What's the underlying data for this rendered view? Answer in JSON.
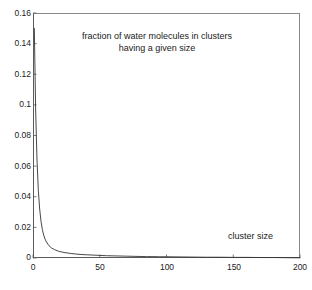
{
  "chart_data": {
    "type": "line",
    "title": "",
    "xlabel": "cluster size",
    "ylabel": "",
    "xlim": [
      0,
      200
    ],
    "ylim": [
      0,
      0.16
    ],
    "grid": false,
    "legend": "none",
    "xticks": [
      "0",
      "50",
      "100",
      "150",
      "200"
    ],
    "xtick_values": [
      0,
      50,
      100,
      150,
      200
    ],
    "yticks": [
      "0",
      "0.02",
      "0.04",
      "0.06",
      "0.08",
      "0.1",
      "0.12",
      "0.14",
      "0.16"
    ],
    "ytick_values": [
      0,
      0.02,
      0.04,
      0.06,
      0.08,
      0.1,
      0.12,
      0.14,
      0.16
    ],
    "annotations": [
      {
        "text_line1": "fraction of water molecules in clusters",
        "text_line2": "having a given size"
      },
      {
        "text": "cluster size"
      }
    ],
    "series": [
      {
        "name": "fraction of water molecules in clusters having a given size",
        "color": "#333333",
        "x": [
          1,
          2,
          3,
          4,
          5,
          6,
          7,
          8,
          9,
          10,
          12,
          14,
          16,
          18,
          20,
          24,
          28,
          32,
          36,
          40,
          45,
          50,
          55,
          60,
          65,
          70,
          75,
          80,
          85,
          90,
          95,
          100,
          110,
          120,
          130,
          140,
          150,
          160,
          170,
          180,
          190,
          200
        ],
        "y": [
          0.15,
          0.096,
          0.064,
          0.044,
          0.032,
          0.024,
          0.0186,
          0.015,
          0.0124,
          0.0105,
          0.008,
          0.0065,
          0.0055,
          0.0048,
          0.0042,
          0.0035,
          0.003,
          0.0026,
          0.0023,
          0.0021,
          0.0019,
          0.0017,
          0.0015,
          0.0014,
          0.0013,
          0.0012,
          0.0011,
          0.001,
          0.0009,
          0.0009,
          0.0008,
          0.0008,
          0.0007,
          0.0006,
          0.0005,
          0.0005,
          0.0004,
          0.0004,
          0.0003,
          0.0003,
          0.0002,
          0.0001
        ]
      }
    ]
  },
  "labels": {
    "title_line1": "fraction of water molecules in clusters",
    "title_line2": "having a given size",
    "cluster_size": "cluster size",
    "y0": "0",
    "y1": "0.02",
    "y2": "0.04",
    "y3": "0.06",
    "y4": "0.08",
    "y5": "0.1",
    "y6": "0.12",
    "y7": "0.14",
    "y8": "0.16",
    "x0": "0",
    "x1": "50",
    "x2": "100",
    "x3": "150",
    "x4": "200"
  },
  "colors": {
    "line": "#333333",
    "axis": "#5a5a5a",
    "text": "#1a1a1a",
    "background": "#ffffff"
  }
}
